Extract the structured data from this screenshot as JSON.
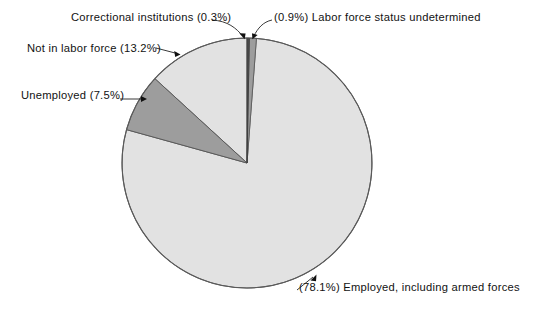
{
  "chart_data": {
    "type": "pie",
    "title": "",
    "subtitle": "",
    "xlabel": "",
    "ylabel": "",
    "legend_position": "none",
    "grid": false,
    "units": "percent",
    "total": 100.0,
    "categories": [
      "Correctional institutions",
      "Labor force status undetermined",
      "Employed, including armed forces",
      "Unemployed",
      "Not in labor force"
    ],
    "values": [
      0.3,
      0.9,
      78.1,
      7.5,
      13.2
    ],
    "slices": [
      {
        "key": "correctional",
        "name": "Correctional institutions",
        "value": 0.3,
        "value_text": "(0.3%)",
        "label": "Correctional institutions (0.3%)",
        "color": "#4d4d4d",
        "start_angle_deg": 0.0,
        "end_angle_deg": 1.08
      },
      {
        "key": "undetermined",
        "name": "Labor force status undetermined",
        "value": 0.9,
        "value_text": "(0.9%)",
        "label": "(0.9%) Labor force status undetermined",
        "color": "#9d9d9d",
        "start_angle_deg": 1.08,
        "end_angle_deg": 4.32
      },
      {
        "key": "employed",
        "name": "Employed, including armed forces",
        "value": 78.1,
        "value_text": "(78.1%)",
        "label": "(78.1%) Employed, including armed forces",
        "color": "#e2e2e2",
        "start_angle_deg": 4.32,
        "end_angle_deg": 285.48
      },
      {
        "key": "unemployed",
        "name": "Unemployed",
        "value": 7.5,
        "value_text": "(7.5%)",
        "label": "Unemployed (7.5%)",
        "color": "#9d9d9d",
        "start_angle_deg": 285.48,
        "end_angle_deg": 312.48
      },
      {
        "key": "notinlabor",
        "name": "Not in labor force",
        "value": 13.2,
        "value_text": "(13.2%)",
        "label": "Not in labor force (13.2%)",
        "color": "#e2e2e2",
        "start_angle_deg": 312.48,
        "end_angle_deg": 360.0
      }
    ],
    "geometry": {
      "center_x": 247,
      "center_y": 163,
      "radius": 125,
      "start_angle_deg": 0,
      "direction": "clockwise"
    },
    "colors": {
      "background": "#ffffff",
      "outline": "#555555",
      "text": "#121212",
      "light_gray": "#e2e2e2",
      "medium_gray": "#9d9d9d",
      "dark_gray": "#4d4d4d"
    }
  },
  "labels": {
    "correctional": "Correctional institutions (0.3%)",
    "undetermined": "(0.9%) Labor force status undetermined",
    "notinlabor": "Not in labor force (13.2%)",
    "unemployed": "Unemployed (7.5%)",
    "employed": "(78.1%) Employed, including armed forces"
  }
}
